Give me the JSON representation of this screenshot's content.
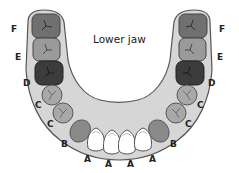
{
  "diagram": {
    "title": "Lower jaw",
    "colors": {
      "gum": "#d6d6d6",
      "outline": "#555555",
      "tooth_F": "#707070",
      "tooth_E": "#9a9a9a",
      "tooth_D": "#3c3c3c",
      "tooth_C": "#a8a8a8",
      "tooth_B": "#8a8a8a",
      "tooth_A": "#ffffff"
    },
    "left_labels": [
      "F",
      "E",
      "D",
      "C",
      "C",
      "B"
    ],
    "right_labels": [
      "F",
      "E",
      "D",
      "C",
      "C",
      "B"
    ],
    "front_labels": [
      "A",
      "A",
      "A",
      "A"
    ]
  }
}
